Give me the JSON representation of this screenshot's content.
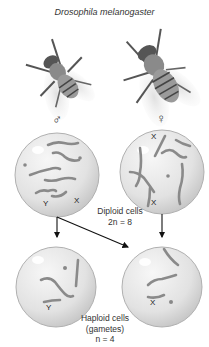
{
  "title": "Drosophila melanogaster",
  "parents": {
    "male": {
      "symbol": "♂",
      "icon": "male-fruit-fly"
    },
    "female": {
      "symbol": "♀",
      "icon": "female-fruit-fly"
    }
  },
  "diploid": {
    "label": "Diploid cells",
    "count_label": "2n = 8",
    "male_cell": {
      "sex_chromosomes": [
        "Y",
        "X"
      ]
    },
    "female_cell": {
      "sex_chromosomes": [
        "X",
        "X"
      ]
    }
  },
  "haploid": {
    "label": "Haploid cells",
    "sublabel": "(gametes)",
    "count_label": "n = 4",
    "left_cell": {
      "sex_chromosome": "Y"
    },
    "right_cell": {
      "sex_chromosome": "X"
    }
  },
  "colors": {
    "cell_fill": "#e6e6e6",
    "cell_edge": "#b5b5b5",
    "chromosome": "#8a8a8a",
    "arrow": "#111111"
  }
}
